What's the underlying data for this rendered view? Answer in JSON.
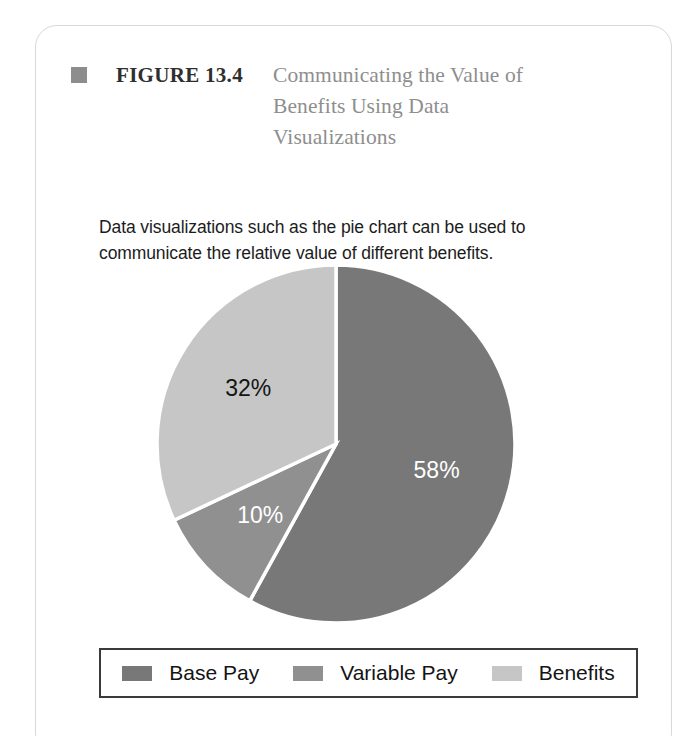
{
  "figure": {
    "bullet_icon": "filled-square-icon",
    "number": "FIGURE 13.4",
    "title": "Communicating the Value of Benefits Using Data Visualizations",
    "caption": "Data visualizations such as the pie chart can be used to communicate the relative value of different benefits."
  },
  "colors": {
    "base_pay": "#787878",
    "variable_pay": "#909090",
    "benefits": "#c6c6c6",
    "slice_divider": "#ffffff",
    "bullet": "#8d8d8d",
    "title_gray": "#8e8e8e",
    "legend_border": "#3a3a3a",
    "card_border": "#d8d8d8"
  },
  "chart_data": {
    "type": "pie",
    "title": "",
    "categories": [
      "Base Pay",
      "Variable Pay",
      "Benefits"
    ],
    "values": [
      58,
      10,
      32
    ],
    "labels": [
      "58%",
      "10%",
      "32%"
    ],
    "label_colors": [
      "#ffffff",
      "#ffffff",
      "#141414"
    ],
    "slice_colors": [
      "#787878",
      "#909090",
      "#c6c6c6"
    ],
    "start_angle_deg": 0,
    "direction": "clockwise",
    "legend": {
      "position": "bottom",
      "entries": [
        {
          "label": "Base Pay",
          "color": "#787878"
        },
        {
          "label": "Variable Pay",
          "color": "#909090"
        },
        {
          "label": "Benefits",
          "color": "#c6c6c6"
        }
      ]
    }
  }
}
